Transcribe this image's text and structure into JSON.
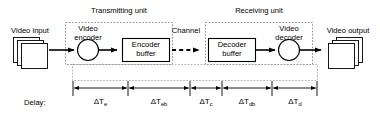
{
  "diagram": {
    "title_labels": {
      "transmitting_unit": "Transmitting unit",
      "receiving_unit": "Receiving unit",
      "channel": "Channel"
    },
    "endpoints": {
      "video_input": "Video input",
      "video_output": "Video output"
    },
    "nodes": {
      "video_encoder_line1": "Video",
      "video_encoder_line2": "encoder",
      "encoder_buffer_line1": "Encoder",
      "encoder_buffer_line2": "buffer",
      "decoder_buffer_line1": "Decoder",
      "decoder_buffer_line2": "buffer",
      "video_decoder_line1": "Video",
      "video_decoder_line2": "decoder"
    },
    "delay": {
      "row_label": "Delay:",
      "segments": [
        {
          "symbol": "ΔT",
          "subscript": "e"
        },
        {
          "symbol": "ΔT",
          "subscript": "eb"
        },
        {
          "symbol": "ΔT",
          "subscript": "c"
        },
        {
          "symbol": "ΔT",
          "subscript": "db"
        },
        {
          "symbol": "ΔT",
          "subscript": "d"
        }
      ]
    },
    "colors": {
      "stroke": "#000000",
      "background": "#ffffff",
      "dashed_group": "#555555"
    }
  }
}
